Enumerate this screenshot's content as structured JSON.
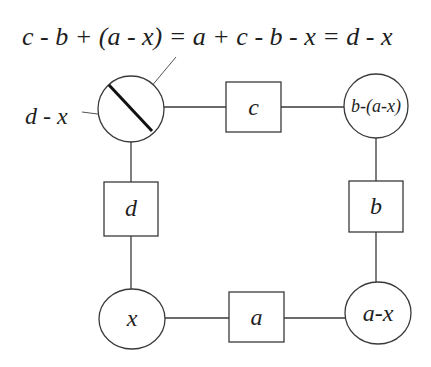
{
  "equation": "c - b + (a - x) = a + c - b - x = d - x",
  "side_label": "d - x",
  "nodes": {
    "top_left": {
      "shape": "circle-with-slash",
      "label": ""
    },
    "top_middle": {
      "shape": "square",
      "label": "c"
    },
    "top_right": {
      "shape": "circle",
      "label": "b-(a-x)"
    },
    "middle_left": {
      "shape": "square",
      "label": "d"
    },
    "middle_right": {
      "shape": "square",
      "label": "b"
    },
    "bottom_left": {
      "shape": "circle",
      "label": "x"
    },
    "bottom_middle": {
      "shape": "square",
      "label": "a"
    },
    "bottom_right": {
      "shape": "circle",
      "label": "a-x"
    }
  },
  "colors": {
    "stroke": "#3a3a3a",
    "slash": "#111111",
    "text": "#1e1e1e",
    "background": "#ffffff"
  }
}
